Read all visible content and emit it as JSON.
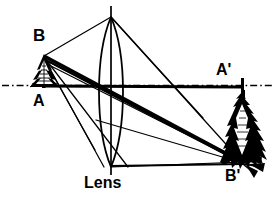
{
  "figure": {
    "caption": "Lens",
    "background_color": "#ffffff",
    "stroke_color": "#000000"
  },
  "labels": {
    "object_top": "B",
    "object_base": "A",
    "image_base": "A'",
    "image_top": "B'",
    "lens": "Lens"
  },
  "diagram_data": {
    "type": "ray-diagram",
    "optical_axis": {
      "style": "dash-dot",
      "y": 85,
      "x_start": 2,
      "x_end": 272
    },
    "lens": {
      "shape": "biconvex",
      "center_x": 111,
      "top_y": 17,
      "bottom_y": 167,
      "half_width": 16,
      "has_principal_axis_line": true
    },
    "object": {
      "name": "tree",
      "orientation": "upright",
      "tip_point": [
        44,
        56
      ],
      "base_point": [
        44,
        86
      ],
      "labels": {
        "top": "B",
        "base": "A"
      }
    },
    "image": {
      "name": "tree",
      "orientation": "inverted",
      "tip_point": [
        243,
        163
      ],
      "base_point": [
        243,
        87
      ],
      "labels": {
        "top": "B'",
        "base": "A'"
      }
    },
    "rays": [
      {
        "from": [
          44,
          56
        ],
        "to": [
          111,
          17
        ],
        "weight": "thin",
        "note": "B to lens top"
      },
      {
        "from": [
          111,
          17
        ],
        "to": [
          243,
          163
        ],
        "weight": "thin",
        "note": "through lens top to B'"
      },
      {
        "from": [
          44,
          56
        ],
        "to": [
          243,
          163
        ],
        "weight": "thick",
        "note": "principal ray B to B'"
      },
      {
        "from": [
          44,
          56
        ],
        "to": [
          127,
          167
        ],
        "weight": "thin",
        "note": "B to lens bottom region"
      },
      {
        "from": [
          44,
          56
        ],
        "to": [
          243,
          163
        ],
        "weight": "thin",
        "note": "converging ray"
      },
      {
        "from": [
          44,
          86
        ],
        "to": [
          243,
          87
        ],
        "weight": "thick",
        "note": "axis ray A to A'"
      },
      {
        "from": [
          111,
          167
        ],
        "to": [
          243,
          164
        ],
        "weight": "medium",
        "note": "lens bottom to B'"
      },
      {
        "from": [
          96,
          167
        ],
        "to": [
          243,
          163
        ],
        "weight": "thin",
        "note": "lens lower edge to B'"
      }
    ]
  }
}
